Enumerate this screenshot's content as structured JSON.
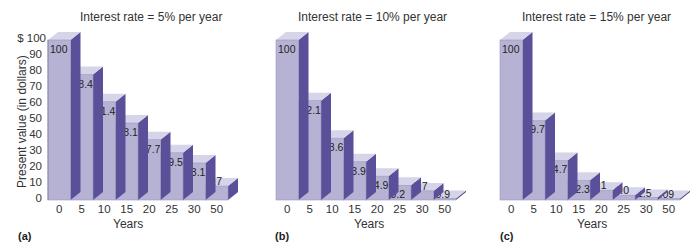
{
  "figure": {
    "ylabel": "Present value (in dollars)",
    "xlabel": "Years",
    "yticks": [
      "$ 100",
      "90",
      "80",
      "70",
      "60",
      "50",
      "40",
      "30",
      "20",
      "10",
      "0"
    ],
    "colors": {
      "front": "#b6b2d4",
      "top": "#d6d4e8",
      "side": "#5a4f99",
      "text": "#222222"
    }
  },
  "panels": [
    {
      "label": "(a)",
      "title": "Interest rate = 5% per year",
      "xlabel": "Years",
      "categories": [
        "0",
        "5",
        "10",
        "15",
        "20",
        "25",
        "30",
        "50"
      ],
      "value_labels": [
        "100",
        "78.4",
        "61.4",
        "48.1",
        "37.7",
        "29.5",
        "23.1",
        "8.7"
      ]
    },
    {
      "label": "(b)",
      "title": "Interest rate = 10% per year",
      "xlabel": "Years",
      "categories": [
        "0",
        "5",
        "10",
        "15",
        "20",
        "25",
        "30",
        "50"
      ],
      "value_labels": [
        "100",
        "62.1",
        "38.6",
        "23.9",
        "14.9",
        "9.2",
        "5.7",
        "0.9"
      ]
    },
    {
      "label": "(c)",
      "title": "Interest rate = 15% per year",
      "xlabel": "Years",
      "categories": [
        "0",
        "5",
        "10",
        "15",
        "20",
        "25",
        "30",
        "50"
      ],
      "value_labels": [
        "100",
        "49.7",
        "24.7",
        "12.3",
        "6.1",
        "3.0",
        "1.5",
        ".09"
      ]
    }
  ],
  "chart_data": [
    {
      "type": "bar",
      "title": "Interest rate = 5% per year",
      "xlabel": "Years",
      "ylabel": "Present value (in dollars)",
      "ylim": [
        0,
        100
      ],
      "categories": [
        "0",
        "5",
        "10",
        "15",
        "20",
        "25",
        "30",
        "50"
      ],
      "values": [
        100,
        78.4,
        61.4,
        48.1,
        37.7,
        29.5,
        23.1,
        8.7
      ],
      "panel": "(a)",
      "grid": false,
      "style": "3D stepped bars"
    },
    {
      "type": "bar",
      "title": "Interest rate = 10% per year",
      "xlabel": "Years",
      "ylabel": "Present value (in dollars)",
      "ylim": [
        0,
        100
      ],
      "categories": [
        "0",
        "5",
        "10",
        "15",
        "20",
        "25",
        "30",
        "50"
      ],
      "values": [
        100,
        62.1,
        38.6,
        23.9,
        14.9,
        9.2,
        5.7,
        0.9
      ],
      "panel": "(b)",
      "grid": false,
      "style": "3D stepped bars"
    },
    {
      "type": "bar",
      "title": "Interest rate = 15% per year",
      "xlabel": "Years",
      "ylabel": "Present value (in dollars)",
      "ylim": [
        0,
        100
      ],
      "categories": [
        "0",
        "5",
        "10",
        "15",
        "20",
        "25",
        "30",
        "50"
      ],
      "values": [
        100,
        49.7,
        24.7,
        12.3,
        6.1,
        3.0,
        1.5,
        0.09
      ],
      "panel": "(c)",
      "grid": false,
      "style": "3D stepped bars"
    }
  ]
}
